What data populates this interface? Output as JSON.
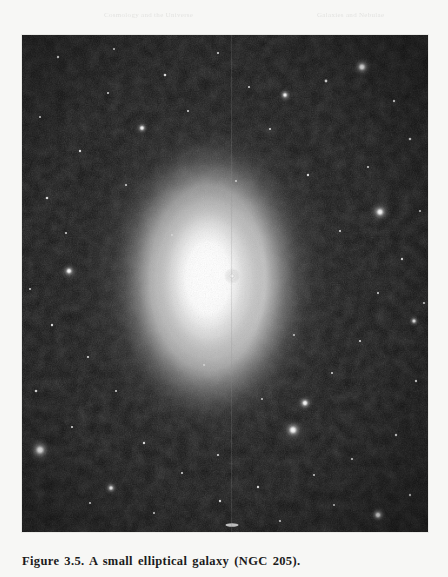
{
  "page": {
    "background_color": "#f7f7f5",
    "width": 448,
    "height": 577
  },
  "running_header": {
    "left_fragment": "Cosmology and the Universe",
    "right_fragment": "Galaxies and Nebulae"
  },
  "figure": {
    "caption": "Figure 3.5. A small elliptical galaxy (NGC 205).",
    "label": "Figure 3.5.",
    "subject": "NGC 205",
    "description": "A small elliptical galaxy",
    "plate": {
      "background_color": "#121212",
      "border_color": "#e9e9e6",
      "left": 22,
      "top": 35,
      "width": 406,
      "height": 497,
      "seam_x": 210,
      "seam_label": "vertical plate seam artifact"
    },
    "galaxy": {
      "name": "NGC 205",
      "type": "elliptical",
      "center_x": 188,
      "center_y": 245,
      "radius_x": 104,
      "radius_y": 150,
      "core_color": "#ffffff",
      "halo_color": "#b8b8b8"
    },
    "bright_stars": [
      {
        "x": 18,
        "y": 415,
        "r": 5.0,
        "halo": 13
      },
      {
        "x": 271,
        "y": 395,
        "r": 4.6,
        "halo": 12
      },
      {
        "x": 358,
        "y": 177,
        "r": 4.2,
        "halo": 11
      },
      {
        "x": 340,
        "y": 32,
        "r": 4.0,
        "halo": 10
      },
      {
        "x": 283,
        "y": 368,
        "r": 3.4,
        "halo": 9
      },
      {
        "x": 47,
        "y": 236,
        "r": 3.2,
        "halo": 8
      },
      {
        "x": 210,
        "y": 241,
        "r": 3.0,
        "halo": 8
      },
      {
        "x": 356,
        "y": 480,
        "r": 3.4,
        "halo": 9
      },
      {
        "x": 120,
        "y": 93,
        "r": 2.8,
        "halo": 7
      },
      {
        "x": 263,
        "y": 60,
        "r": 2.6,
        "halo": 7
      },
      {
        "x": 89,
        "y": 453,
        "r": 2.6,
        "halo": 7
      },
      {
        "x": 392,
        "y": 286,
        "r": 2.4,
        "halo": 6
      }
    ],
    "streak": {
      "x": 210,
      "y": 490,
      "width": 13,
      "height": 3.4,
      "label": "edge-on smudge"
    }
  }
}
